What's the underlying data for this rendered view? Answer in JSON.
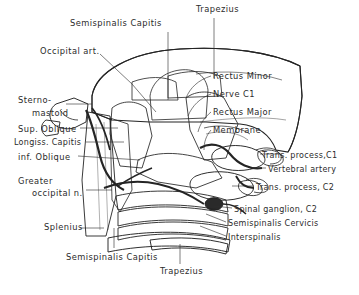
{
  "figure": {
    "background": "#ffffff",
    "ink": "#242424"
  },
  "labels": {
    "top": [
      {
        "id": "trapezius-top",
        "text": "Trapezius",
        "x": 196,
        "y": 8
      },
      {
        "id": "semispinalis-capitis-top",
        "text": "Semispinalis Capitis",
        "x": 70,
        "y": 22
      },
      {
        "id": "occipital-art",
        "text": "Occipital art.",
        "x": 40,
        "y": 50
      }
    ],
    "left": [
      {
        "id": "sterno",
        "text": "Sterno-",
        "x": 18,
        "y": 98
      },
      {
        "id": "mastoid",
        "text": "mastoid",
        "x": 28,
        "y": 112
      },
      {
        "id": "sup-oblique",
        "text": "Sup. Oblique",
        "x": 18,
        "y": 130
      },
      {
        "id": "longiss-capitis",
        "text": "Longiss. Capitis",
        "x": 14,
        "y": 144
      },
      {
        "id": "inf-oblique",
        "text": "inf. Oblique",
        "x": 18,
        "y": 158
      },
      {
        "id": "greater",
        "text": "Greater",
        "x": 18,
        "y": 182
      },
      {
        "id": "occipital-n",
        "text": "occipital n.",
        "x": 28,
        "y": 194
      }
    ],
    "right": [
      {
        "id": "rectus-minor",
        "text": "Rectus Minor",
        "x": 213,
        "y": 76
      },
      {
        "id": "nerve-c1",
        "text": "Nerve C1",
        "x": 213,
        "y": 94
      },
      {
        "id": "rectus-major",
        "text": "Rectus Major",
        "x": 213,
        "y": 112
      },
      {
        "id": "membrane",
        "text": "Membrane",
        "x": 213,
        "y": 130
      },
      {
        "id": "trans-process-c1",
        "text": "Trans. process,C1",
        "x": 262,
        "y": 156
      },
      {
        "id": "vertebral-artery",
        "text": "Vertebral artery",
        "x": 268,
        "y": 170
      },
      {
        "id": "trans-process-c2",
        "text": "Trans. process, C2",
        "x": 256,
        "y": 188
      },
      {
        "id": "spinal-ganglion",
        "text": "Spinal ganglion, C2",
        "x": 234,
        "y": 210
      },
      {
        "id": "semispinalis-cerv",
        "text": "Semispinalis Cervicis",
        "x": 228,
        "y": 224
      },
      {
        "id": "interspinalis",
        "text": "Interspinalis",
        "x": 228,
        "y": 238
      }
    ],
    "bottom": [
      {
        "id": "splenius",
        "text": "Splenius",
        "x": 44,
        "y": 226
      },
      {
        "id": "semispinalis-capitis-bot",
        "text": "Semispinalis Capitis",
        "x": 66,
        "y": 256
      },
      {
        "id": "trapezius-bot",
        "text": "Trapezius",
        "x": 160,
        "y": 270
      }
    ]
  }
}
